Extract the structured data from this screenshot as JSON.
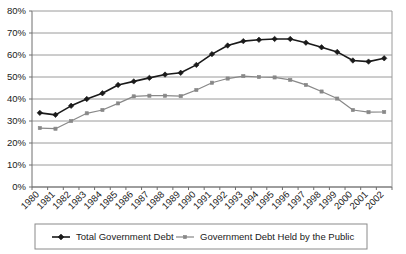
{
  "chart_data": {
    "type": "line",
    "title": "",
    "subtitle": "",
    "xlabel": "",
    "ylabel": "",
    "grid": true,
    "legend_position": "bottom",
    "ylim": [
      0,
      80
    ],
    "ytick_labels": [
      "0%",
      "10%",
      "20%",
      "30%",
      "40%",
      "50%",
      "60%",
      "70%",
      "80%"
    ],
    "ytick_values": [
      0,
      10,
      20,
      30,
      40,
      50,
      60,
      70,
      80
    ],
    "categories": [
      "1980",
      "1981",
      "1982",
      "1983",
      "1984",
      "1985",
      "1986",
      "1987",
      "1988",
      "1989",
      "1990",
      "1991",
      "1992",
      "1993",
      "1994",
      "1995",
      "1996",
      "1997",
      "1998",
      "1999",
      "2000",
      "2001",
      "2002"
    ],
    "series": [
      {
        "name": "Total Government Debt",
        "color": "#1a1a1a",
        "marker": "diamond",
        "values": [
          33.7,
          32.8,
          36.9,
          40.0,
          42.6,
          46.4,
          48.0,
          49.6,
          51.1,
          51.9,
          55.5,
          60.4,
          64.3,
          66.3,
          66.9,
          67.3,
          67.3,
          65.6,
          63.5,
          61.4,
          57.5,
          57.0,
          58.5
        ]
      },
      {
        "name": "Government Debt Held by the Public",
        "color": "#888888",
        "marker": "square",
        "values": [
          26.8,
          26.5,
          30.0,
          33.5,
          35.0,
          38.0,
          41.2,
          41.5,
          41.5,
          41.3,
          44.1,
          47.4,
          49.3,
          50.4,
          50.0,
          49.8,
          48.7,
          46.4,
          43.4,
          40.2,
          35.0,
          34.0,
          34.1
        ]
      }
    ]
  },
  "legend": {
    "items": [
      {
        "label": "Total Government Debt",
        "color": "#1a1a1a",
        "marker": "diamond"
      },
      {
        "label": "Government Debt Held by the Public",
        "color": "#888888",
        "marker": "square"
      }
    ]
  },
  "colors": {
    "series_total": "#1a1a1a",
    "series_public": "#888888",
    "gridline": "#9a9a9a",
    "axis": "#6e6e6e",
    "plot_background": "#ffffff",
    "text": "#1a1a1a"
  }
}
